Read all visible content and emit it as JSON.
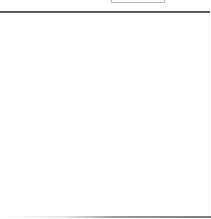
{
  "window": {
    "title": ""
  },
  "top_control": {
    "label": ""
  },
  "content_panel": {
    "text": ""
  }
}
